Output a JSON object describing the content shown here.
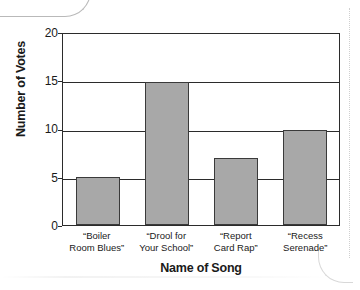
{
  "chart_data": {
    "type": "bar",
    "title": "",
    "categories": [
      "“Boiler Room Blues”",
      "“Drool for Your School”",
      "“Report Card Rap”",
      "“Recess Serenade”"
    ],
    "category_lines": [
      [
        "“Boiler",
        "Room Blues”"
      ],
      [
        "“Drool for",
        "Your School”"
      ],
      [
        "“Report",
        "Card Rap”"
      ],
      [
        "“Recess",
        "Serenade”"
      ]
    ],
    "values": [
      5,
      15,
      7,
      10
    ],
    "xlabel": "Name of Song",
    "ylabel": "Number of Votes",
    "ylim": [
      0,
      20
    ],
    "y_ticks": [
      "0",
      "5",
      "10",
      "15",
      "20"
    ],
    "y_tick_values": [
      0,
      5,
      10,
      15,
      20
    ],
    "grid": "horizontal",
    "legend": "none",
    "bar_color": "#a8a8a8",
    "bar_border_color": "#3a3a3a",
    "axis_color": "#2b2b2b"
  }
}
